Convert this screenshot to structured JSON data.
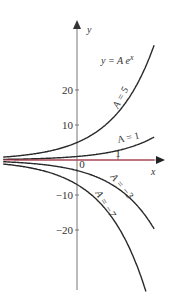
{
  "chart_data": {
    "type": "line",
    "formula_label": "y = A e",
    "formula_exp": "x",
    "xlabel": "x",
    "ylabel": "y",
    "xlim": [
      -1.8,
      1.9
    ],
    "ylim": [
      -38,
      40
    ],
    "x_ticks": [
      {
        "value": 0,
        "label": "0"
      },
      {
        "value": 1,
        "label": "1"
      }
    ],
    "y_ticks": [
      {
        "value": 20,
        "label": "20"
      },
      {
        "value": 10,
        "label": "10"
      },
      {
        "value": -10,
        "label": "−10"
      },
      {
        "value": -20,
        "label": "−20"
      }
    ],
    "grid": false,
    "series": [
      {
        "name": "A = 5",
        "A": 5,
        "color": "#2a2a2a",
        "label": "A = 5"
      },
      {
        "name": "A = 1",
        "A": 1,
        "color": "#2a2a2a",
        "label": "A = 1"
      },
      {
        "name": "A = 0",
        "A": 0,
        "color": "#c0304a",
        "label": ""
      },
      {
        "name": "A = −3",
        "A": -3,
        "color": "#2a2a2a",
        "label": "A = −3"
      },
      {
        "name": "A = −7",
        "A": -7,
        "color": "#2a2a2a",
        "label": "A = −7"
      }
    ]
  }
}
